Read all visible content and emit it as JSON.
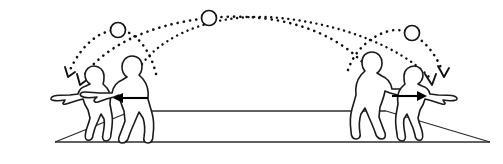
{
  "diagram": {
    "background_color": "#ffffff",
    "ink_color": "#111111",
    "width": 503,
    "height": 164,
    "ground": {
      "name": "raised-mound-platform",
      "base_line_y": 142,
      "top_edge_y": 111,
      "left_apex_x": 55,
      "right_apex_x": 490,
      "top_left_x": 132,
      "top_right_x": 386,
      "stroke_color": "#2b2b2b"
    },
    "balls": [
      {
        "label": "ball-left",
        "cx": 118,
        "cy": 30,
        "r": 7.5
      },
      {
        "label": "ball-center",
        "cx": 209,
        "cy": 18,
        "r": 7.5
      },
      {
        "label": "ball-right",
        "cx": 412,
        "cy": 33,
        "r": 7.5
      }
    ],
    "figures": [
      {
        "label": "child-left",
        "role": "small-figure",
        "facing": "left",
        "x": 78,
        "ground": "slope"
      },
      {
        "label": "adult-left",
        "role": "large-figure",
        "facing": "left",
        "x": 128,
        "ground": "top"
      },
      {
        "label": "adult-right",
        "role": "large-figure",
        "facing": "right",
        "x": 378,
        "ground": "top"
      },
      {
        "label": "child-right",
        "role": "small-figure",
        "facing": "right",
        "x": 428,
        "ground": "slope"
      }
    ],
    "push_arrows": [
      {
        "label": "push-arrow-left",
        "direction": "left",
        "x1": 148,
        "x2": 113,
        "y": 98
      },
      {
        "label": "push-arrow-right",
        "direction": "right",
        "x1": 392,
        "x2": 427,
        "y": 96
      }
    ],
    "trajectories": [
      {
        "label": "trajectory-short-left",
        "style": "dotted",
        "from": "adult-left",
        "to": "child-left",
        "apex_ball": "ball-left"
      },
      {
        "label": "trajectory-long-left",
        "style": "dotted",
        "from": "adult-right",
        "to": "child-left",
        "apex_ball": "ball-center"
      },
      {
        "label": "trajectory-short-right",
        "style": "dotted",
        "from": "adult-right",
        "to": "child-right",
        "apex_ball": "ball-right"
      },
      {
        "label": "trajectory-long-right",
        "style": "dotted",
        "from": "adult-left",
        "to": "child-right",
        "apex_ball": "ball-center"
      }
    ]
  }
}
